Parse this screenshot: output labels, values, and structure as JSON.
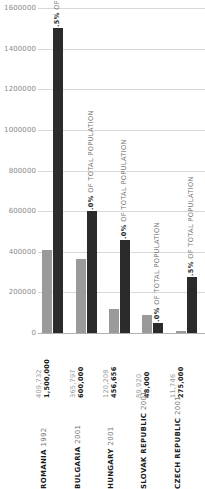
{
  "chart_data": {
    "type": "bar",
    "title": "",
    "xlabel": "",
    "ylabel": "",
    "ylim": [
      0,
      1600000
    ],
    "grid": true,
    "legend_position": "none",
    "categories": [
      "ROMANIA 1992",
      "BULGARIA 2001",
      "HUNGARY 2001",
      "SLOVAK REPUBLIC 2001",
      "CZECH REPUBLIC 2001"
    ],
    "category_names": [
      "ROMANIA",
      "BULGARIA",
      "HUNGARY",
      "SLOVAK REPUBLIC",
      "CZECH REPUBLIC"
    ],
    "category_years": [
      "1992",
      "2001",
      "2001",
      "2001",
      "2001"
    ],
    "ytick_labels": [
      "0",
      "200000",
      "400000",
      "600000",
      "800000",
      "1000000",
      "1200000",
      "1400000",
      "1600000"
    ],
    "ytick_values": [
      0,
      200000,
      400000,
      600000,
      800000,
      1000000,
      1200000,
      1400000,
      1600000
    ],
    "series": [
      {
        "name": "census",
        "color": "#9a9a9a",
        "values": [
          409732,
          365797,
          120208,
          89920,
          11746
        ],
        "value_labels": [
          "409,732",
          "365,797",
          "120,208",
          "89,920",
          "11,746"
        ]
      },
      {
        "name": "estimate",
        "color": "#2b2b2b",
        "values": [
          1500000,
          600000,
          456656,
          48000,
          275000
        ],
        "value_labels": [
          "1,500,000",
          "600,000",
          "456,656",
          "48,000",
          "275,000"
        ]
      }
    ],
    "annotations": [
      {
        "percent": "6.5%",
        "text": "OF TOTAL POPULATION"
      },
      {
        "percent": "7.0%",
        "text": "OF TOTAL POPULATION"
      },
      {
        "percent": "5.0%",
        "text": "OF TOTAL POPULATION"
      },
      {
        "percent": "9.0%",
        "text": "OF TOTAL POPULATION"
      },
      {
        "percent": "2.5%",
        "text": "OF TOTAL POPULATION"
      }
    ]
  }
}
